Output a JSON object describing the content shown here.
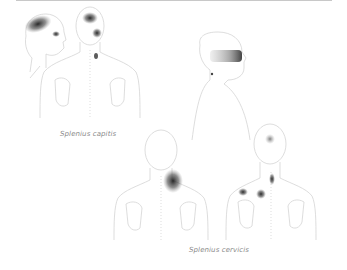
{
  "diagram": {
    "panels": [
      {
        "caption": "Splenius capitis",
        "figures": [
          "head-side-view-left",
          "head-and-shoulders-back-view",
          "head-and-torso-side-view-right"
        ],
        "pain_zones": [
          "top-of-head",
          "behind-eye",
          "vertex",
          "upper-neck-trigger-point",
          "temple-band"
        ]
      },
      {
        "caption": "Splenius cervicis",
        "figures": [
          "back-view-with-neck-shoulder-referral",
          "back-view-with-trigger-points"
        ],
        "pain_zones": [
          "neck-shoulder-angle",
          "back-of-head",
          "lateral-neck-trigger-point",
          "upper-back-trigger-points"
        ]
      }
    ],
    "colors": {
      "outline": "#d4d4d4",
      "pain_dark": "#1e1e1e",
      "pain_light": "#9a9a9a",
      "caption": "#8a8a8a",
      "top_rule": "#c8c8c8"
    }
  }
}
